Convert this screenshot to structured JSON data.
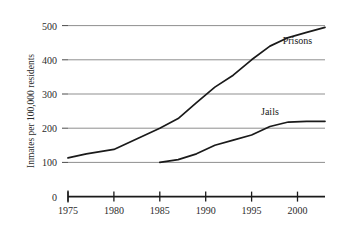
{
  "chart_data": {
    "type": "line",
    "title": "",
    "xlabel": "",
    "ylabel": "Inmates per 100,000 residents",
    "xlim": [
      1975,
      2003
    ],
    "ylim": [
      0,
      500
    ],
    "xticks": [
      1975,
      1980,
      1985,
      1990,
      1995,
      2000
    ],
    "xtick_labels": [
      "1975",
      "1980",
      "1985",
      "1990",
      "1995",
      "2000"
    ],
    "yticks": [
      0,
      100,
      200,
      300,
      400,
      500
    ],
    "ytick_labels": [
      "0",
      "100",
      "200",
      "300",
      "400",
      "500"
    ],
    "grid": true,
    "grid_color": "#9a9a9a",
    "legend_position": "inline-labels",
    "line_color": "#1a1a1a",
    "series": [
      {
        "name": "Prisons",
        "label_x": 2000,
        "label_y": 445,
        "x": [
          1975,
          1977,
          1980,
          1983,
          1985,
          1987,
          1989,
          1991,
          1993,
          1995,
          1997,
          1999,
          2001,
          2003
        ],
        "values": [
          113,
          125,
          138,
          175,
          200,
          228,
          275,
          320,
          355,
          400,
          440,
          465,
          480,
          495
        ]
      },
      {
        "name": "Jails",
        "label_x": 1997,
        "label_y": 240,
        "x": [
          1985,
          1987,
          1989,
          1991,
          1993,
          1995,
          1997,
          1999,
          2001,
          2003
        ],
        "values": [
          100,
          108,
          125,
          150,
          165,
          180,
          205,
          218,
          220,
          220
        ]
      }
    ]
  },
  "axis": {
    "y_title": "Inmates per 100,000 residents"
  }
}
